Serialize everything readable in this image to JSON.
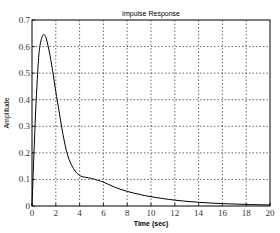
{
  "chart_data": {
    "type": "line",
    "title": "Impulse Response",
    "xlabel": "Time (sec)",
    "ylabel": "Amplitude",
    "xlim": [
      0,
      20
    ],
    "ylim": [
      0,
      0.7
    ],
    "grid": true,
    "legend": null,
    "xticks": [
      0,
      2,
      4,
      6,
      8,
      10,
      12,
      14,
      16,
      18,
      20
    ],
    "yticks": [
      0,
      0.1,
      0.2,
      0.3,
      0.4,
      0.5,
      0.6,
      0.7
    ],
    "xtick_labels": [
      "0",
      "2",
      "4",
      "6",
      "8",
      "10",
      "12",
      "14",
      "16",
      "18",
      "20"
    ],
    "ytick_labels": [
      "0",
      "0.1",
      "0.2",
      "0.3",
      "0.4",
      "0.5",
      "0.6",
      "0.7"
    ],
    "series": [
      {
        "name": "Impulse Response",
        "color": "#000000",
        "x": [
          0,
          0.15,
          0.3,
          0.45,
          0.6,
          0.8,
          1.0,
          1.2,
          1.5,
          1.8,
          2.0,
          2.3,
          2.6,
          3.0,
          3.5,
          4.0,
          4.5,
          5.0,
          5.5,
          6.0,
          7.0,
          8.0,
          9.0,
          10.0,
          12.0,
          14.0,
          16.0,
          18.0,
          20.0
        ],
        "values": [
          0,
          0.18,
          0.35,
          0.48,
          0.58,
          0.63,
          0.645,
          0.63,
          0.57,
          0.49,
          0.43,
          0.35,
          0.27,
          0.19,
          0.14,
          0.115,
          0.108,
          0.104,
          0.097,
          0.09,
          0.07,
          0.055,
          0.044,
          0.035,
          0.022,
          0.014,
          0.009,
          0.006,
          0.004
        ]
      }
    ]
  }
}
